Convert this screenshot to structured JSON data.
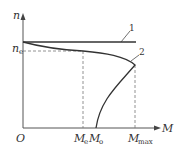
{
  "diagram": {
    "axes": {
      "y_label": "n",
      "x_label": "M",
      "origin_label": "O"
    },
    "y_ticks": [
      {
        "main": "n",
        "sub": "e"
      }
    ],
    "x_ticks": [
      {
        "main": "M",
        "sub": "e"
      },
      {
        "main": "M",
        "sub": "o"
      },
      {
        "main": "M",
        "sub": "max"
      }
    ],
    "curves": [
      {
        "id": "1",
        "label": "1",
        "description": "horizontal line (constant speed)"
      },
      {
        "id": "2",
        "label": "2",
        "description": "speed-torque curve peaking at M_max"
      }
    ],
    "colors": {
      "line": "#333333",
      "dash": "#666666",
      "background": "#ffffff"
    }
  }
}
